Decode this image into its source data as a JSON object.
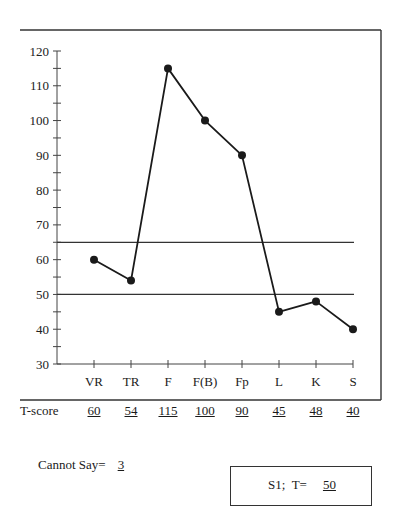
{
  "chart_data": {
    "type": "line",
    "title": "",
    "xlabel": "",
    "ylabel": "",
    "categories": [
      "VR",
      "TR",
      "F",
      "F(B)",
      "Fp",
      "L",
      "K",
      "S"
    ],
    "series": [
      {
        "name": "T-score",
        "values": [
          60,
          54,
          115,
          100,
          90,
          45,
          48,
          40
        ]
      }
    ],
    "ylim": [
      30,
      120
    ],
    "yticks": [
      30,
      40,
      50,
      60,
      70,
      80,
      90,
      100,
      110,
      120
    ],
    "minor_ytick_step": 5,
    "reference_lines": [
      65,
      50
    ],
    "grid": false,
    "legend": "none",
    "markers": "filled-circle"
  },
  "table": {
    "row_label": "T-score",
    "values": [
      "60",
      "54",
      "115",
      "100",
      "90",
      "45",
      "48",
      "40"
    ]
  },
  "cannot_say": {
    "label": "Cannot Say=",
    "value": "3"
  },
  "s1_box": {
    "label": "S1;  T=",
    "value": "50"
  },
  "colors": {
    "line": "#1a1a1a",
    "frame": "#333333"
  }
}
